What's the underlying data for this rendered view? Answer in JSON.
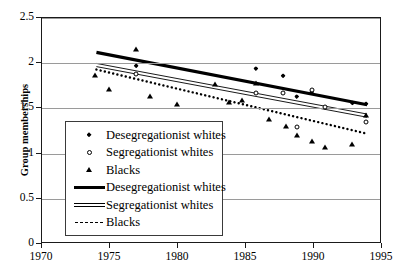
{
  "chart_data": {
    "type": "scatter",
    "title": "",
    "xlabel": "",
    "ylabel": "Group memberships",
    "xlim": [
      1970,
      1995
    ],
    "ylim": [
      0,
      2.5
    ],
    "xticks": [
      1970,
      1975,
      1980,
      1985,
      1990,
      1995
    ],
    "yticks": [
      "0",
      "0.5",
      "1",
      "1.5",
      "2",
      "2.5"
    ],
    "ytick_values": [
      0,
      0.5,
      1,
      1.5,
      2,
      2.5
    ],
    "grid": "horizontal",
    "legend_position": "inside-lower-left",
    "series": [
      {
        "name": "Desegregationist whites",
        "kind": "scatter",
        "marker": "filled-diamond",
        "points": [
          {
            "x": 1977.0,
            "y": 1.96
          },
          {
            "x": 1985.8,
            "y": 1.93
          },
          {
            "x": 1987.8,
            "y": 1.85
          },
          {
            "x": 1988.8,
            "y": 1.62
          },
          {
            "x": 1989.9,
            "y": 1.67
          },
          {
            "x": 1992.9,
            "y": 1.55
          },
          {
            "x": 1993.9,
            "y": 1.54
          }
        ]
      },
      {
        "name": "Segregationist whites",
        "kind": "scatter",
        "marker": "open-circle",
        "points": [
          {
            "x": 1977.0,
            "y": 1.87
          },
          {
            "x": 1985.8,
            "y": 1.66
          },
          {
            "x": 1987.8,
            "y": 1.66
          },
          {
            "x": 1988.8,
            "y": 1.28
          },
          {
            "x": 1989.9,
            "y": 1.69
          },
          {
            "x": 1990.9,
            "y": 1.5
          },
          {
            "x": 1993.9,
            "y": 1.34
          }
        ]
      },
      {
        "name": "Blacks",
        "kind": "scatter",
        "marker": "filled-triangle",
        "points": [
          {
            "x": 1974.0,
            "y": 1.86
          },
          {
            "x": 1975.0,
            "y": 1.7
          },
          {
            "x": 1977.0,
            "y": 2.15
          },
          {
            "x": 1978.0,
            "y": 1.63
          },
          {
            "x": 1980.0,
            "y": 1.54
          },
          {
            "x": 1982.8,
            "y": 1.76
          },
          {
            "x": 1983.8,
            "y": 1.56
          },
          {
            "x": 1984.8,
            "y": 1.58
          },
          {
            "x": 1985.8,
            "y": 1.77
          },
          {
            "x": 1986.8,
            "y": 1.37
          },
          {
            "x": 1988.0,
            "y": 1.29
          },
          {
            "x": 1988.8,
            "y": 1.19
          },
          {
            "x": 1989.9,
            "y": 1.13
          },
          {
            "x": 1990.9,
            "y": 1.06
          },
          {
            "x": 1992.9,
            "y": 1.1
          },
          {
            "x": 1993.9,
            "y": 1.42
          }
        ]
      },
      {
        "name": "Desegregationist whites",
        "kind": "trend",
        "line_style": "thick-solid",
        "start": {
          "x": 1974.0,
          "y": 2.12
        },
        "end": {
          "x": 1993.9,
          "y": 1.54
        }
      },
      {
        "name": "Segregationist whites",
        "kind": "trend",
        "line_style": "double-thin-solid",
        "start": {
          "x": 1974.0,
          "y": 1.98
        },
        "end": {
          "x": 1993.9,
          "y": 1.42
        }
      },
      {
        "name": "Blacks",
        "kind": "trend",
        "line_style": "dotted",
        "start": {
          "x": 1974.0,
          "y": 1.93
        },
        "end": {
          "x": 1993.9,
          "y": 1.22
        }
      }
    ],
    "legend": [
      {
        "label": "Desegregationist whites",
        "key": "filled-diamond"
      },
      {
        "label": "Segregationist whites",
        "key": "open-circle"
      },
      {
        "label": "Blacks",
        "key": "filled-triangle"
      },
      {
        "label": "Desegregationist  whites",
        "key": "thick-solid-line"
      },
      {
        "label": "Segregationist whites",
        "key": "double-thin-line"
      },
      {
        "label": "Blacks",
        "key": "dotted-line"
      }
    ]
  }
}
